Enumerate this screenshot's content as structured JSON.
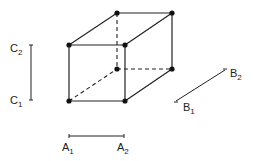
{
  "diagram": {
    "title": "",
    "colors": {
      "ink": "#222222",
      "background": "#ffffff"
    },
    "vertices": [
      {
        "id": "front-top-left",
        "x": 69,
        "y": 45
      },
      {
        "id": "front-top-right",
        "x": 125,
        "y": 45
      },
      {
        "id": "front-bottom-left",
        "x": 69,
        "y": 101
      },
      {
        "id": "front-bottom-right",
        "x": 125,
        "y": 101
      },
      {
        "id": "back-top-left",
        "x": 117,
        "y": 13
      },
      {
        "id": "back-top-right",
        "x": 172,
        "y": 13
      },
      {
        "id": "back-bottom-left",
        "x": 117,
        "y": 69
      },
      {
        "id": "back-bottom-right",
        "x": 172,
        "y": 69
      }
    ],
    "axes": {
      "A": {
        "low": {
          "letter": "A",
          "sub": "1"
        },
        "high": {
          "letter": "A",
          "sub": "2"
        }
      },
      "B": {
        "low": {
          "letter": "B",
          "sub": "1"
        },
        "high": {
          "letter": "B",
          "sub": "2"
        }
      },
      "C": {
        "low": {
          "letter": "C",
          "sub": "1"
        },
        "high": {
          "letter": "C",
          "sub": "2"
        }
      }
    }
  }
}
